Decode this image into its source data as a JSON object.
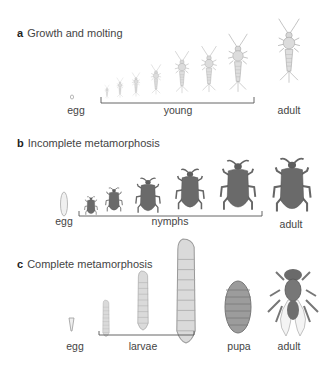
{
  "panels": [
    {
      "letter": "a",
      "title": "Growth and molting",
      "labels": {
        "egg": "egg",
        "young": "young",
        "adult": "adult"
      }
    },
    {
      "letter": "b",
      "title": "Incomplete metamorphosis",
      "labels": {
        "egg": "egg",
        "young": "nymphs",
        "adult": "adult"
      }
    },
    {
      "letter": "c",
      "title": "Complete metamorphosis",
      "labels": {
        "egg": "egg",
        "young": "larvae",
        "pupa": "pupa",
        "adult": "adult"
      }
    }
  ],
  "colors": {
    "silverfish": "#c8c8c8",
    "bug": "#6e6e6e",
    "bug_dark": "#555555",
    "larva": "#d6d6d6",
    "pupa": "#9a9a9a",
    "bracket": "#555555"
  }
}
